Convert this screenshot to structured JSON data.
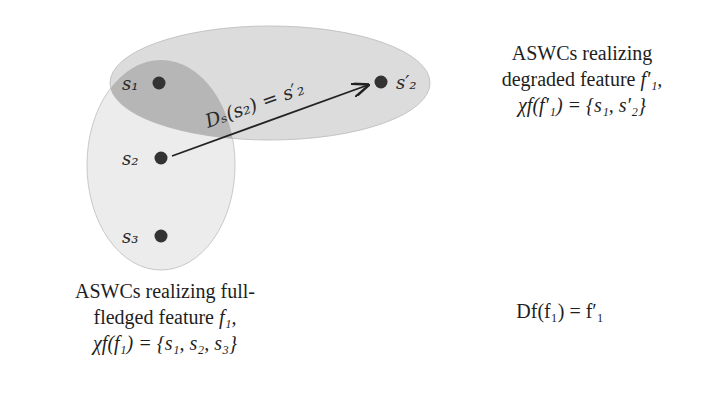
{
  "diagram": {
    "nodes": [
      {
        "id": "s1",
        "label": "s₁",
        "x": 159,
        "y": 83
      },
      {
        "id": "s2",
        "label": "s₂",
        "x": 161,
        "y": 158
      },
      {
        "id": "s3",
        "label": "s₃",
        "x": 161,
        "y": 236
      },
      {
        "id": "s2p",
        "label": "s′₂",
        "x": 381,
        "y": 82
      }
    ],
    "sets": [
      {
        "id": "full-fledged-set",
        "members": [
          "s1",
          "s2",
          "s3"
        ],
        "fill": "#e6e6e6"
      },
      {
        "id": "degraded-set",
        "members": [
          "s1",
          "s2p"
        ],
        "fill": "#d9d9d9"
      },
      {
        "id": "overlap",
        "fill": "#b3b3b3"
      }
    ],
    "edge": {
      "from": "s2",
      "to": "s2p",
      "label": "Dₛ(s₂) = s′₂"
    }
  },
  "captions": {
    "degraded": {
      "line1": "ASWCs realizing",
      "line2_text": "degraded feature ",
      "line2_math": "f′₁,",
      "line3": "χf(f′₁) = {s₁, s′₂}"
    },
    "full": {
      "line1": "ASWCs realizing full-",
      "line2_text": "fledged feature ",
      "line2_math": "f₁,",
      "line3": "χf(f₁) = {s₁, s₂, s₃}"
    },
    "mapping": "Df(f₁) = f′₁"
  }
}
